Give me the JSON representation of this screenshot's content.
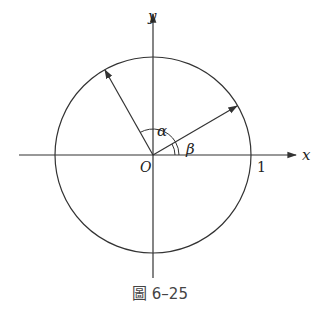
{
  "figure": {
    "caption": "圖 6–25",
    "axes": {
      "x_label": "x",
      "y_label": "y",
      "origin_label": "O",
      "unit_tick_label": "1"
    },
    "angles": {
      "alpha": "α",
      "beta": "β"
    },
    "elements": {
      "circle": "unit circle centered at origin",
      "vector_1": "arrow from O at angle β above positive x-axis (~30°)",
      "vector_2": "arrow from O at angle α from vector_1 (~120° from x-axis)"
    },
    "colors": {
      "stroke": "#333333",
      "caption": "#444444"
    }
  }
}
